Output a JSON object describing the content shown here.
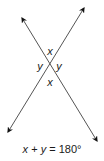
{
  "diagram": {
    "lines": [
      {
        "name": "line-a",
        "from": [
          8,
          132
        ],
        "to": [
          84,
          8
        ]
      },
      {
        "name": "line-b",
        "from": [
          22,
          18
        ],
        "to": [
          97,
          141
        ]
      }
    ],
    "intersection": [
      50,
      66
    ],
    "angle_labels": {
      "top": "x",
      "left": "y",
      "right": "y",
      "bottom": "x"
    },
    "equation": {
      "x": "x",
      "plus": " + ",
      "y": "y",
      "rest": " = 180°"
    },
    "colors": {
      "line": "#555555",
      "arrowhead": "#111111",
      "text": "#1a1a1a"
    }
  }
}
